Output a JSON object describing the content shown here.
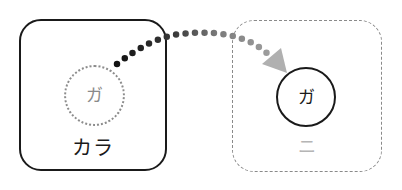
{
  "diagram": {
    "left_box": {
      "style": "solid",
      "circle_char": "ガ",
      "circle_style": "dotted",
      "label": "カラ"
    },
    "right_box": {
      "style": "dashed",
      "circle_char": "ガ",
      "circle_style": "solid",
      "label": "ニ"
    },
    "connector": {
      "type": "dotted-arc-arrow",
      "from": "left_box.circle",
      "to": "right_box.circle",
      "start_color": "#111111",
      "end_color": "#a8a8a8"
    }
  },
  "colors": {
    "ink": "#1a1a1a",
    "ghost": "#8a8a8a",
    "faint": "#b5b5b5",
    "arrowhead": "#b0b0b0"
  }
}
